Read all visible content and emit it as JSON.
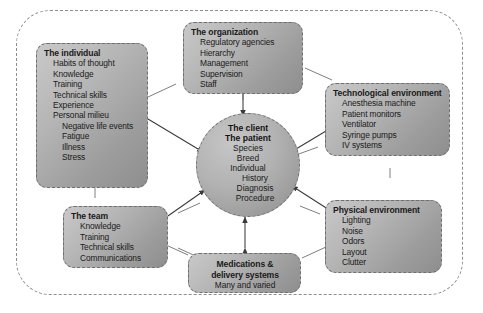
{
  "diagram": {
    "type": "system-influence-diagram",
    "boundary": {
      "style": "dashed-rounded-rectangle"
    },
    "center": {
      "name": "client-patient",
      "titles": [
        "The client",
        "The patient"
      ],
      "items": [
        "Species",
        "Breed",
        "Individual",
        "History",
        "Diagnosis",
        "Procedure"
      ]
    },
    "nodes": [
      {
        "id": "individual",
        "title": "The individual",
        "items": [
          "Habits of thought",
          "Knowledge",
          "Training",
          "Technical skills",
          "Experience",
          "Personal milieu"
        ],
        "subitems": [
          "Negative life events",
          "Fatigue",
          "Illness",
          "Stress"
        ]
      },
      {
        "id": "organization",
        "title": "The organization",
        "items": [
          "Regulatory agencies",
          "Hierarchy",
          "Management",
          "Supervision",
          "Staff"
        ],
        "subitems": []
      },
      {
        "id": "technological-environment",
        "title": "Technological environment",
        "items": [
          "Anesthesia machine",
          "Patient monitors",
          "Ventilator",
          "Syringe pumps",
          "IV systems"
        ],
        "subitems": []
      },
      {
        "id": "physical-environment",
        "title": "Physical environment",
        "items": [
          "Lighting",
          "Noise",
          "Odors",
          "Layout",
          "Clutter"
        ],
        "subitems": []
      },
      {
        "id": "medications",
        "title_line1": "Medications &",
        "title_line2": "delivery systems",
        "items": [
          "Many and varied"
        ],
        "subitems": []
      },
      {
        "id": "team",
        "title": "The team",
        "items": [
          "Knowledge",
          "Training",
          "Technical skills",
          "Communications"
        ],
        "subitems": []
      }
    ],
    "colors": {
      "node_fill_light": "#c9c9c9",
      "node_fill_dark": "#8e8e8e",
      "border": "#6f6f6f",
      "boundary": "#8d8d8d",
      "text": "#1a1a1a",
      "arrow": "#3a3a3a",
      "background": "#ffffff"
    }
  }
}
